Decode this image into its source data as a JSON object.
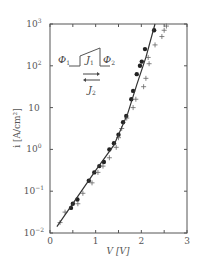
{
  "chart_data": {
    "type": "scatter",
    "title": "",
    "xlabel": "V [V]",
    "ylabel": "i [A/cm²]",
    "xlim": [
      0,
      3
    ],
    "ylim_log10": [
      -2,
      3
    ],
    "yscale": "log",
    "grid": false,
    "x_ticks": [
      {
        "v": 0,
        "label": "0"
      },
      {
        "v": 0.5,
        "label": ""
      },
      {
        "v": 1,
        "label": "1"
      },
      {
        "v": 1.5,
        "label": ""
      },
      {
        "v": 2,
        "label": "2"
      },
      {
        "v": 2.5,
        "label": ""
      },
      {
        "v": 3,
        "label": "3"
      }
    ],
    "y_ticks": [
      {
        "exp": -2,
        "base": "10",
        "sup": "−2"
      },
      {
        "exp": -1,
        "base": "10",
        "sup": "−1"
      },
      {
        "exp": 0,
        "base": "10",
        "sup": "0"
      },
      {
        "exp": 1,
        "base": "10",
        "sup": ""
      },
      {
        "exp": 2,
        "base": "10",
        "sup": "2"
      },
      {
        "exp": 3,
        "base": "10",
        "sup": "3"
      }
    ],
    "series": [
      {
        "name": "measured (filled circles)",
        "marker": "dot",
        "points": [
          [
            0.46,
            -1.4
          ],
          [
            0.5,
            -1.3
          ],
          [
            0.6,
            -1.2
          ],
          [
            0.85,
            -0.75
          ],
          [
            0.97,
            -0.55
          ],
          [
            1.08,
            -0.4
          ],
          [
            1.18,
            -0.3
          ],
          [
            1.3,
            0.0
          ],
          [
            1.4,
            0.15
          ],
          [
            1.5,
            0.35
          ],
          [
            1.6,
            0.65
          ],
          [
            1.67,
            0.8
          ],
          [
            1.78,
            1.2
          ],
          [
            1.82,
            1.4
          ],
          [
            1.9,
            1.8
          ],
          [
            1.97,
            2.0
          ],
          [
            2.01,
            2.1
          ],
          [
            2.08,
            2.4
          ],
          [
            2.28,
            2.85
          ]
        ]
      },
      {
        "name": "measured (crosses)",
        "marker": "plus",
        "points": [
          [
            0.22,
            -1.75
          ],
          [
            0.33,
            -1.5
          ],
          [
            0.61,
            -1.3
          ],
          [
            0.72,
            -1.05
          ],
          [
            0.92,
            -0.8
          ],
          [
            1.05,
            -0.55
          ],
          [
            1.16,
            -0.4
          ],
          [
            1.3,
            -0.2
          ],
          [
            1.45,
            0.05
          ],
          [
            1.5,
            0.28
          ],
          [
            1.57,
            0.5
          ],
          [
            1.68,
            0.75
          ],
          [
            1.82,
            1.0
          ],
          [
            1.88,
            1.2
          ],
          [
            2.05,
            1.5
          ],
          [
            2.1,
            1.7
          ],
          [
            2.17,
            2.05
          ],
          [
            2.15,
            2.2
          ],
          [
            2.3,
            2.5
          ],
          [
            2.45,
            2.7
          ],
          [
            2.5,
            2.85
          ],
          [
            2.55,
            2.95
          ]
        ]
      },
      {
        "name": "theory (solid line)",
        "marker": "line",
        "points": [
          [
            0.15,
            -1.85
          ],
          [
            0.5,
            -1.3
          ],
          [
            1.0,
            -0.5
          ],
          [
            1.4,
            0.1
          ],
          [
            1.7,
            0.85
          ],
          [
            1.9,
            1.55
          ],
          [
            2.1,
            2.2
          ],
          [
            2.3,
            3.0
          ]
        ]
      }
    ],
    "inset": {
      "type": "barrier-diagram",
      "labels": {
        "phi1": "Φ",
        "phi1_sub": "1",
        "j1": "J",
        "j1_sub": "1",
        "phi2": "Φ",
        "phi2_sub": "2",
        "j2": "J",
        "j2_sub": "2"
      },
      "arrows": [
        "right",
        "left"
      ]
    }
  },
  "axes": {
    "x_title": "V [V]",
    "y_title": "i [A/cm²]"
  }
}
